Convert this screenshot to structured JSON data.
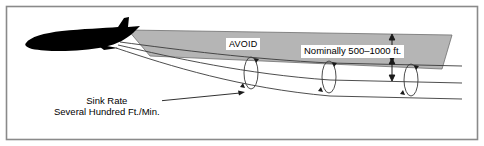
{
  "figure": {
    "border_color": "#8a8a8a",
    "background_color": "#ffffff",
    "wake_fill_color": "#b5b5b5",
    "aircraft_color": "#000000",
    "line_color": "#3a3a3a",
    "labels": {
      "avoid": "AVOID",
      "nominal_altitude": "Nominally 500–1000 ft.",
      "sink_rate_line1": "Sink Rate",
      "sink_rate_line2": "Several Hundred Ft./Min."
    },
    "icons": {
      "aircraft": "airplane-silhouette-icon",
      "vortex": "vortex-rotation-icon",
      "dimension": "dimension-arrow-icon",
      "leader": "leader-line-icon"
    }
  }
}
